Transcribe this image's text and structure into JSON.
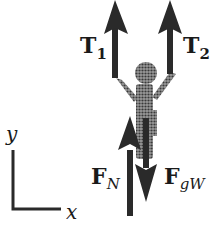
{
  "diagram": {
    "forces": [
      {
        "id": "T1",
        "label": "T",
        "subscript": "1",
        "direction": "up"
      },
      {
        "id": "T2",
        "label": "T",
        "subscript": "2",
        "direction": "up"
      },
      {
        "id": "FN",
        "label": "F",
        "subscript": "N",
        "direction": "up"
      },
      {
        "id": "FgW",
        "label": "F",
        "subscript": "gW",
        "direction": "down"
      }
    ],
    "axes": {
      "y_label": "y",
      "x_label": "x"
    },
    "colors": {
      "arrow": "#2a2a2a",
      "figure": "#6f6f6f",
      "text": "#1a1a1a"
    }
  }
}
